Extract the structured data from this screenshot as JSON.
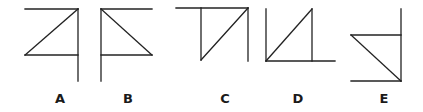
{
  "figures": [
    {
      "label": "A",
      "label_x": 60
    },
    {
      "label": "B",
      "label_x": 128
    },
    {
      "label": "C",
      "label_x": 225
    },
    {
      "label": "D",
      "label_x": 298
    },
    {
      "label": "E",
      "label_x": 384
    }
  ],
  "stroke_color": "#222222"
}
